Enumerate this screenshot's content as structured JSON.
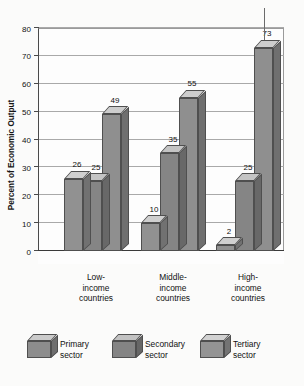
{
  "chart_data": {
    "type": "bar",
    "title": "",
    "subtitle": "",
    "xlabel": "",
    "ylabel": "Percent of Economic Output",
    "ylim": [
      0,
      80
    ],
    "ytick_step": 10,
    "yticks": [
      "80",
      "70",
      "60",
      "50",
      "40",
      "30",
      "20",
      "10",
      "0"
    ],
    "grid": true,
    "grid_axis": "y",
    "legend_position": "bottom",
    "style": "3d-grouped-bars-grayscale",
    "categories": [
      "Low-income countries",
      "Middle-income countries",
      "High-income countries"
    ],
    "category_lines": [
      [
        "Low-",
        "income",
        "countries"
      ],
      [
        "Middle-",
        "income",
        "countries"
      ],
      [
        "High-",
        "income",
        "countries"
      ]
    ],
    "series": [
      {
        "name": "Primary sector",
        "values": [
          26,
          25,
          2
        ]
      },
      {
        "name": "Secondary sector",
        "values": [
          25,
          35,
          25
        ]
      },
      {
        "name": "Tertiary sector",
        "values": [
          49,
          55,
          73
        ]
      }
    ],
    "bar_groups": [
      {
        "category": "Low-income countries",
        "bars": [
          {
            "series": "Primary sector",
            "value": 26
          },
          {
            "series": "Secondary sector",
            "value": 25
          },
          {
            "series": "Tertiary sector",
            "value": 49
          }
        ]
      },
      {
        "category": "Middle-income countries",
        "bars": [
          {
            "series": "Primary sector",
            "value": 10
          },
          {
            "series": "Secondary sector",
            "value": 35
          },
          {
            "series": "Tertiary sector",
            "value": 55
          }
        ]
      },
      {
        "category": "High-income countries",
        "bars": [
          {
            "series": "Primary sector",
            "value": 2
          },
          {
            "series": "Secondary sector",
            "value": 25
          },
          {
            "series": "Tertiary sector",
            "value": 73
          }
        ]
      }
    ],
    "annotations": [
      {
        "type": "leader-line",
        "target_value": 73,
        "target_series": "Tertiary sector",
        "target_category": "High-income countries"
      }
    ],
    "colors": {
      "background": "#fbfbfa",
      "plot_background": "#fdfdfd",
      "gridline": "#a9a9a9",
      "axis": "#3a3a3a",
      "text": "#111111",
      "bar_front": "#8c8c8c",
      "bar_top": "#c9c9c9",
      "bar_side": "#6e6e6e",
      "bar_outline": "#4f4f4f"
    }
  },
  "legend": {
    "items": [
      {
        "label_line1": "Primary",
        "label_line2": "sector",
        "icon": "cube-icon"
      },
      {
        "label_line1": "Secondary",
        "label_line2": "sector",
        "icon": "cube-icon"
      },
      {
        "label_line1": "Tertiary",
        "label_line2": "sector",
        "icon": "cube-icon"
      }
    ]
  }
}
